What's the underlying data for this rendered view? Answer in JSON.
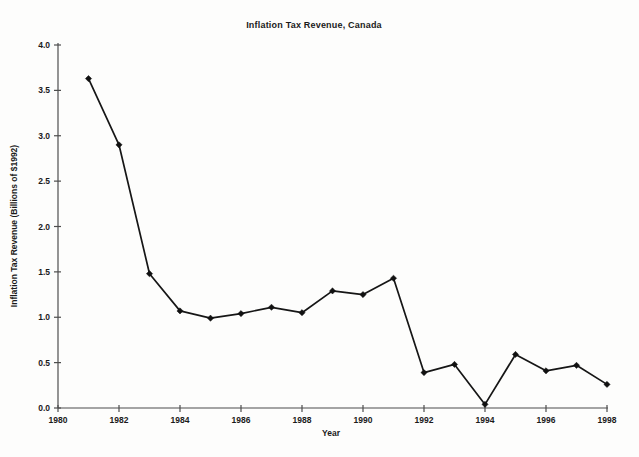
{
  "page": {
    "background": "#fdfdfc",
    "width": 639,
    "height": 457
  },
  "chart_data": {
    "type": "line",
    "title": "Inflation Tax Revenue, Canada",
    "xlabel": "Year",
    "ylabel": "Inflation Tax Revenue (Billions of $1992)",
    "x": [
      1981,
      1982,
      1983,
      1984,
      1985,
      1986,
      1987,
      1988,
      1989,
      1990,
      1991,
      1992,
      1993,
      1994,
      1995,
      1996,
      1997,
      1998
    ],
    "values": [
      3.63,
      2.9,
      1.48,
      1.07,
      0.99,
      1.04,
      1.11,
      1.05,
      1.29,
      1.25,
      1.43,
      0.39,
      0.48,
      0.04,
      0.59,
      0.41,
      0.47,
      0.26
    ],
    "xlim": [
      1980,
      1998
    ],
    "ylim": [
      0,
      4
    ],
    "x_ticks": [
      1980,
      1982,
      1984,
      1986,
      1988,
      1990,
      1992,
      1994,
      1996,
      1998
    ],
    "x_tick_labels": [
      "1980",
      "1982",
      "1984",
      "1986",
      "1988",
      "1990",
      "1992",
      "1994",
      "1996",
      "1998"
    ],
    "y_ticks": [
      0.0,
      0.5,
      1.0,
      1.5,
      2.0,
      2.5,
      3.0,
      3.5,
      4.0
    ],
    "y_tick_labels": [
      "0.0",
      "0.5",
      "1.0",
      "1.5",
      "2.0",
      "2.5",
      "3.0",
      "3.5",
      "4.0"
    ],
    "grid": "off",
    "legend": "none",
    "marker": "diamond",
    "line_color": "#161616",
    "marker_color": "#111111",
    "axis_color": "#4d4d4d",
    "text_color": "#1a1a1a"
  }
}
